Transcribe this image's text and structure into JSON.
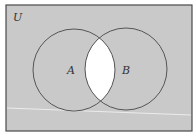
{
  "diagram": {
    "type": "venn",
    "universe_label": "U",
    "sets": [
      {
        "label": "A",
        "cx": 74,
        "cy": 70,
        "r": 41
      },
      {
        "label": "B",
        "cx": 126,
        "cy": 69,
        "r": 41
      }
    ],
    "shaded_region": "complement of A∩B (intersection unshaded)",
    "colors": {
      "shade": "#c9c9c9",
      "unshaded": "#ffffff",
      "outline": "#555555",
      "frame": "#4a4a4a"
    }
  }
}
